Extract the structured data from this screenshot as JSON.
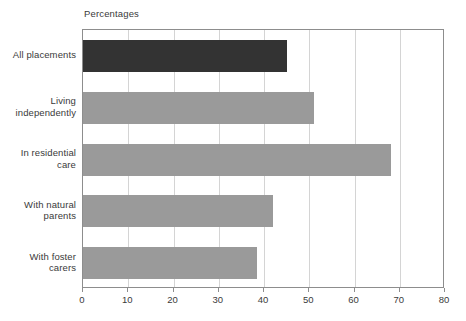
{
  "chart_data": {
    "type": "bar",
    "orientation": "horizontal",
    "title": "Percentages",
    "xlabel": "",
    "ylabel": "",
    "xlim": [
      0,
      80
    ],
    "xticks": [
      0,
      10,
      20,
      30,
      40,
      50,
      60,
      70,
      80
    ],
    "xtick_labels": [
      "0",
      "10",
      "20",
      "30",
      "40",
      "50",
      "60",
      "70",
      "80"
    ],
    "grid": true,
    "legend": "none",
    "categories": [
      "All placements",
      "Living independently",
      "In residential care",
      "With natural parents",
      "With foster carers"
    ],
    "category_lines": [
      [
        "All placements"
      ],
      [
        "Living",
        "independently"
      ],
      [
        "In residential",
        "care"
      ],
      [
        "With natural",
        "parents"
      ],
      [
        "With foster",
        "carers"
      ]
    ],
    "values": [
      45,
      51,
      68,
      42,
      38.5
    ],
    "bar_colors": [
      "#333333",
      "#9a9a9a",
      "#9a9a9a",
      "#9a9a9a",
      "#9a9a9a"
    ]
  },
  "colors": {
    "bar_dark": "#333333",
    "bar_light": "#9a9a9a",
    "grid": "#d4d4d4",
    "frame": "#8d8d8d",
    "text": "#3a3a3a",
    "background": "#ffffff"
  }
}
